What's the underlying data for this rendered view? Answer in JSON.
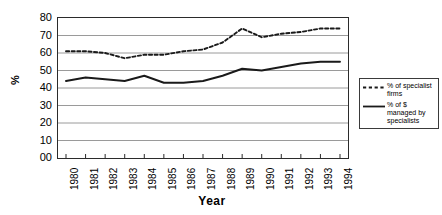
{
  "chart_data": {
    "type": "line",
    "title": "",
    "xlabel": "Year",
    "ylabel": "%",
    "grid": true,
    "legend_position": "right",
    "ylim": [
      0,
      80
    ],
    "ytick_labels": [
      "80",
      "70",
      "60",
      "50",
      "40",
      "30",
      "20",
      "10",
      "00"
    ],
    "yticks": [
      80,
      70,
      60,
      50,
      40,
      30,
      20,
      10,
      0
    ],
    "categories": [
      "1980",
      "1981",
      "1982",
      "1983",
      "1984",
      "1985",
      "1986",
      "1987",
      "1988",
      "1989",
      "1990",
      "1991",
      "1992",
      "1993",
      "1994"
    ],
    "x": [
      1980,
      1981,
      1982,
      1983,
      1984,
      1985,
      1986,
      1987,
      1988,
      1989,
      1990,
      1991,
      1992,
      1993,
      1994
    ],
    "series": [
      {
        "name": "% of specialist firms",
        "style": "dashed",
        "color": "#1a1a1a",
        "values": [
          61,
          61,
          60,
          57,
          59,
          59,
          61,
          62,
          66,
          74,
          69,
          71,
          72,
          74,
          74
        ]
      },
      {
        "name": "% of $ managed by specialists",
        "style": "solid",
        "color": "#1a1a1a",
        "values": [
          44,
          46,
          45,
          44,
          47,
          43,
          43,
          44,
          47,
          51,
          50,
          52,
          54,
          55,
          55
        ]
      }
    ]
  },
  "legend": {
    "entries": [
      {
        "label": "% of specialist firms",
        "style": "dashed"
      },
      {
        "label": "% of $ managed by specialists",
        "style": "solid"
      }
    ]
  },
  "axes": {
    "y_title": "%",
    "x_title": "Year"
  }
}
